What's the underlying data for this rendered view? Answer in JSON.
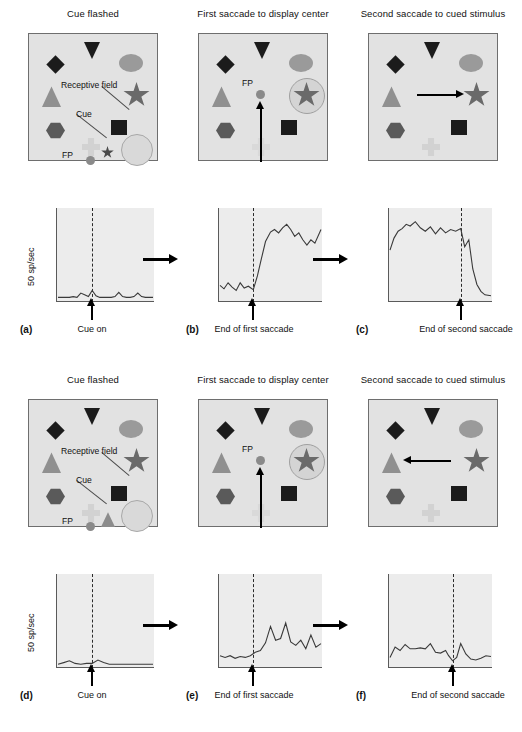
{
  "figure": {
    "units_label": "50 sp/sec",
    "panel_titles": {
      "cue": "Cue flashed",
      "first": "First saccade to\ndisplay center",
      "second": "Second saccade to\ncued stimulus"
    },
    "annotations": {
      "receptive_field": "Receptive field",
      "cue": "Cue",
      "fp": "FP"
    },
    "events": {
      "cue_on": "Cue on",
      "end_first": "End of first\nsaccade",
      "end_second": "End of second\nsaccade"
    }
  },
  "rows": [
    {
      "id": "row-top",
      "panels": [
        {
          "letter": "(a)",
          "title": "Cue flashed",
          "event": "Cue on"
        },
        {
          "letter": "(b)",
          "title": "First saccade to\ndisplay center",
          "event": "End of first\nsaccade"
        },
        {
          "letter": "(c)",
          "title": "Second saccade to\ncued stimulus",
          "event": "End of second\nsaccade"
        }
      ]
    },
    {
      "id": "row-bottom",
      "panels": [
        {
          "letter": "(d)",
          "title": "Cue flashed",
          "event": "Cue on"
        },
        {
          "letter": "(e)",
          "title": "First saccade to\ndisplay center",
          "event": "End of first\nsaccade"
        },
        {
          "letter": "(f)",
          "title": "Second saccade to\ncued stimulus",
          "event": "End of second\nsaccade"
        }
      ]
    }
  ],
  "colors": {
    "display_bg": "#e2e2e2",
    "plot_bg": "#ececec",
    "dark_shape": "#1b1b1b",
    "mid_shape": "#5a5a5a",
    "light_shape": "#909090",
    "star": "#6a6a6a",
    "cross": "#d2d2d2",
    "rf_circle": "#d9d9d9",
    "trace": "#3a3a3a"
  },
  "chart_data": [
    {
      "id": "a",
      "type": "line",
      "title": "Cue flashed",
      "panel_letter": "(a)",
      "ylabel": "50 sp/sec",
      "xlabel": "Cue on",
      "event_marker_x": 0.36,
      "ylim": [
        0,
        100
      ],
      "grid": false,
      "legend": null,
      "description": "Baseline firing; no response to the cue flashed outside the receptive field.",
      "x": [
        0,
        0.04,
        0.08,
        0.12,
        0.16,
        0.2,
        0.24,
        0.28,
        0.32,
        0.36,
        0.4,
        0.44,
        0.48,
        0.52,
        0.56,
        0.6,
        0.64,
        0.68,
        0.72,
        0.76,
        0.8,
        0.84,
        0.88,
        0.92,
        0.96,
        1.0
      ],
      "y": [
        3,
        3,
        3,
        3,
        4,
        3,
        8,
        6,
        4,
        11,
        5,
        3,
        3,
        3,
        3,
        4,
        9,
        4,
        3,
        3,
        4,
        8,
        4,
        3,
        3,
        3
      ]
    },
    {
      "id": "b",
      "type": "line",
      "title": "First saccade to display center",
      "panel_letter": "(b)",
      "ylabel": "50 sp/sec",
      "xlabel": "End of first saccade",
      "event_marker_x": 0.33,
      "ylim": [
        0,
        100
      ],
      "grid": false,
      "legend": null,
      "description": "Strong elevation of firing beginning at the end of the first saccade, when the cued stimulus enters the receptive field.",
      "x": [
        0,
        0.04,
        0.08,
        0.12,
        0.16,
        0.2,
        0.24,
        0.28,
        0.33,
        0.37,
        0.41,
        0.45,
        0.5,
        0.54,
        0.58,
        0.62,
        0.66,
        0.7,
        0.74,
        0.78,
        0.82,
        0.86,
        0.9,
        0.94,
        1.0
      ],
      "y": [
        17,
        13,
        20,
        15,
        11,
        20,
        14,
        16,
        12,
        28,
        48,
        68,
        79,
        82,
        78,
        84,
        88,
        82,
        74,
        78,
        70,
        64,
        70,
        66,
        82
      ]
    },
    {
      "id": "c",
      "type": "line",
      "title": "Second saccade to cued stimulus",
      "panel_letter": "(c)",
      "ylabel": "50 sp/sec",
      "xlabel": "End of second saccade",
      "event_marker_x": 0.7,
      "ylim": [
        0,
        100
      ],
      "grid": false,
      "legend": null,
      "description": "Sustained high firing that collapses sharply after the end of the second saccade.",
      "x": [
        0,
        0.04,
        0.08,
        0.12,
        0.16,
        0.2,
        0.25,
        0.3,
        0.35,
        0.4,
        0.45,
        0.5,
        0.55,
        0.6,
        0.65,
        0.7,
        0.74,
        0.78,
        0.82,
        0.86,
        0.9,
        0.94,
        1.0
      ],
      "y": [
        58,
        72,
        80,
        83,
        88,
        86,
        91,
        84,
        80,
        85,
        77,
        84,
        78,
        82,
        80,
        83,
        62,
        70,
        36,
        18,
        10,
        6,
        5
      ]
    },
    {
      "id": "d",
      "type": "line",
      "title": "Cue flashed",
      "panel_letter": "(d)",
      "ylabel": "50 sp/sec",
      "xlabel": "Cue on",
      "event_marker_x": 0.36,
      "ylim": [
        0,
        100
      ],
      "grid": false,
      "legend": null,
      "description": "Baseline firing; essentially no response when the cue is flashed at the opposite location.",
      "x": [
        0,
        0.06,
        0.12,
        0.18,
        0.24,
        0.3,
        0.36,
        0.42,
        0.48,
        0.54,
        0.6,
        0.66,
        0.72,
        0.78,
        0.84,
        0.9,
        0.96,
        1.0
      ],
      "y": [
        2,
        4,
        6,
        3,
        2,
        3,
        3,
        7,
        4,
        2,
        2,
        2,
        2,
        2,
        2,
        2,
        2,
        2
      ]
    },
    {
      "id": "e",
      "type": "line",
      "title": "First saccade to display center",
      "panel_letter": "(e)",
      "ylabel": "50 sp/sec",
      "xlabel": "End of first saccade",
      "event_marker_x": 0.33,
      "ylim": [
        0,
        100
      ],
      "grid": false,
      "legend": null,
      "description": "Modest increase in firing after the first saccade with several transient peaks.",
      "x": [
        0,
        0.05,
        0.1,
        0.15,
        0.2,
        0.25,
        0.3,
        0.35,
        0.4,
        0.45,
        0.5,
        0.55,
        0.6,
        0.65,
        0.7,
        0.75,
        0.8,
        0.85,
        0.9,
        0.95,
        1.0
      ],
      "y": [
        12,
        10,
        12,
        9,
        11,
        10,
        12,
        16,
        18,
        27,
        46,
        30,
        32,
        50,
        28,
        24,
        30,
        20,
        36,
        22,
        26
      ]
    },
    {
      "id": "f",
      "type": "line",
      "title": "Second saccade to cued stimulus",
      "panel_letter": "(f)",
      "ylabel": "50 sp/sec",
      "xlabel": "End of second saccade",
      "event_marker_x": 0.62,
      "ylim": [
        0,
        100
      ],
      "grid": false,
      "legend": null,
      "description": "Low level firing throughout, with a small transient just after the second saccade.",
      "x": [
        0,
        0.05,
        0.1,
        0.15,
        0.2,
        0.25,
        0.3,
        0.35,
        0.4,
        0.45,
        0.5,
        0.55,
        0.58,
        0.62,
        0.66,
        0.7,
        0.75,
        0.8,
        0.85,
        0.9,
        0.95,
        1.0
      ],
      "y": [
        10,
        22,
        18,
        25,
        20,
        20,
        21,
        20,
        26,
        16,
        15,
        18,
        12,
        6,
        10,
        26,
        14,
        8,
        7,
        9,
        12,
        11
      ]
    }
  ],
  "stimulus_displays": [
    {
      "id": "a",
      "shapes": [
        "triangle-down-dark",
        "diamond-dark",
        "triangle-up-gray",
        "hexagon-gray",
        "ellipse-gray",
        "star-gray",
        "square-dark",
        "cross-light",
        "fixation-dot"
      ],
      "receptive_field": "large circle at lower right",
      "cue_shape": "small dark star near fixation point",
      "saccade": null
    },
    {
      "id": "b",
      "receptive_field": "small circle around the star",
      "saccade": "upward arrow to fixation point",
      "fp_label": "FP"
    },
    {
      "id": "c",
      "receptive_field": null,
      "saccade": "rightward arrow to star"
    },
    {
      "id": "d",
      "receptive_field": "large circle at lower right",
      "cue_shape": "small gray triangle near fixation point",
      "saccade": null
    },
    {
      "id": "e",
      "receptive_field": "small circle around the star",
      "saccade": "upward arrow to fixation point",
      "fp_label": "FP"
    },
    {
      "id": "f",
      "receptive_field": null,
      "saccade": "leftward arrow to triangle"
    }
  ]
}
